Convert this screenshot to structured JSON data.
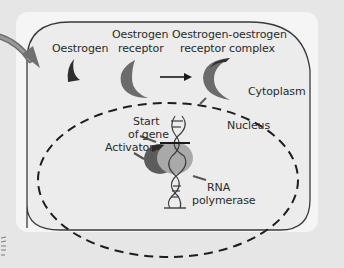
{
  "diagram": {
    "colors": {
      "page_background": "#e6e6e6",
      "card_background": "#f5f5f5",
      "cell_fill": "#ececec",
      "outline": "#3a3a3a",
      "oestrogen": "#2e2e2e",
      "receptor": "#6b6b6b",
      "complex_dark": "#3a3a3a",
      "polymerase": "#a9a9a9",
      "activator": "#5c5c5c",
      "entry_arrow": "#7a7a7a"
    },
    "labels": {
      "oestrogen": "Oestrogen",
      "receptor_line1": "Oestrogen",
      "receptor_line2": "receptor",
      "complex_line1": "Oestrogen-oestrogen",
      "complex_line2": "receptor complex",
      "cytoplasm": "Cytoplasm",
      "nucleus": "Nucleus",
      "start_line1": "Start",
      "start_line2": "of gene",
      "activator": "Activator",
      "rna_line1": "RNA",
      "rna_line2": "polymerase"
    },
    "icons": {
      "entry_arrow": "curved-arrow",
      "reaction_arrow": "right-arrow",
      "oestrogen_shape": "small-crescent",
      "receptor_shape": "crescent",
      "complex_shape": "crescent-pair",
      "dna": "double-helix",
      "pointer": "small-arrow"
    }
  }
}
